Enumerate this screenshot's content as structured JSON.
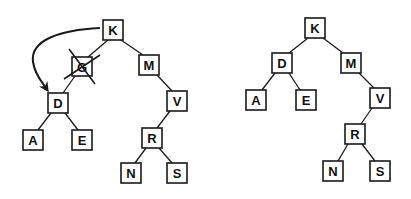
{
  "diagram": {
    "left_tree": {
      "nodes": [
        {
          "id": "K",
          "label": "K",
          "x": 113,
          "y": 30
        },
        {
          "id": "G",
          "label": "G",
          "x": 82,
          "y": 66,
          "deleted": true
        },
        {
          "id": "M",
          "label": "M",
          "x": 149,
          "y": 65
        },
        {
          "id": "D",
          "label": "D",
          "x": 58,
          "y": 103
        },
        {
          "id": "V",
          "label": "V",
          "x": 177,
          "y": 101
        },
        {
          "id": "A",
          "label": "A",
          "x": 33,
          "y": 140
        },
        {
          "id": "E",
          "label": "E",
          "x": 82,
          "y": 140
        },
        {
          "id": "R",
          "label": "R",
          "x": 152,
          "y": 138
        },
        {
          "id": "N",
          "label": "N",
          "x": 131,
          "y": 173
        },
        {
          "id": "S",
          "label": "S",
          "x": 177,
          "y": 173
        }
      ],
      "edges": [
        [
          "K",
          "G"
        ],
        [
          "K",
          "M"
        ],
        [
          "G",
          "D"
        ],
        [
          "M",
          "V"
        ],
        [
          "D",
          "A"
        ],
        [
          "D",
          "E"
        ],
        [
          "V",
          "R"
        ],
        [
          "R",
          "N"
        ],
        [
          "R",
          "S"
        ]
      ],
      "arrow": {
        "from": "K",
        "to": "D",
        "description": "curved arrow indicating D replaces deleted G"
      }
    },
    "right_tree": {
      "nodes": [
        {
          "id": "K",
          "label": "K",
          "x": 315,
          "y": 28
        },
        {
          "id": "D",
          "label": "D",
          "x": 282,
          "y": 63
        },
        {
          "id": "M",
          "label": "M",
          "x": 351,
          "y": 63
        },
        {
          "id": "A",
          "label": "A",
          "x": 256,
          "y": 100
        },
        {
          "id": "E",
          "label": "E",
          "x": 306,
          "y": 100
        },
        {
          "id": "V",
          "label": "V",
          "x": 380,
          "y": 98
        },
        {
          "id": "R",
          "label": "R",
          "x": 355,
          "y": 134
        },
        {
          "id": "N",
          "label": "N",
          "x": 333,
          "y": 171
        },
        {
          "id": "S",
          "label": "S",
          "x": 380,
          "y": 171
        }
      ],
      "edges": [
        [
          "K",
          "D"
        ],
        [
          "K",
          "M"
        ],
        [
          "D",
          "A"
        ],
        [
          "D",
          "E"
        ],
        [
          "M",
          "V"
        ],
        [
          "V",
          "R"
        ],
        [
          "R",
          "N"
        ],
        [
          "R",
          "S"
        ]
      ]
    },
    "labels": {
      "left": {
        "K": "K",
        "G": "G",
        "M": "M",
        "D": "D",
        "V": "V",
        "A": "A",
        "E": "E",
        "R": "R",
        "N": "N",
        "S": "S"
      },
      "right": {
        "K": "K",
        "D": "D",
        "M": "M",
        "A": "A",
        "E": "E",
        "V": "V",
        "R": "R",
        "N": "N",
        "S": "S"
      }
    }
  }
}
